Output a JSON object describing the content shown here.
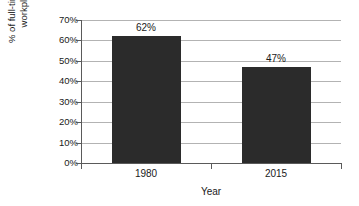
{
  "chart_data": {
    "type": "bar",
    "title": "",
    "categories": [
      "1980",
      "2015"
    ],
    "values": [
      62,
      47
    ],
    "data_labels": [
      "62%",
      "47%"
    ],
    "xlabel": "Year",
    "ylabel": "% of full-time workers covered by workplace retirement plan",
    "ylabel_lines": [
      "% of full-time workers covered by",
      "workplace retirement plan"
    ],
    "ylim": [
      0,
      70
    ],
    "ytick_step": 10,
    "ytick_labels": [
      "0%",
      "10%",
      "20%",
      "30%",
      "40%",
      "50%",
      "60%",
      "70%"
    ],
    "ytick_values": [
      0,
      10,
      20,
      30,
      40,
      50,
      60,
      70
    ],
    "grid": true,
    "legend": false,
    "bar_color": "#2b2b2b",
    "gridline_color": "#b3b3b3",
    "axis_color": "#5a5a5a",
    "background_color": "#ffffff"
  }
}
